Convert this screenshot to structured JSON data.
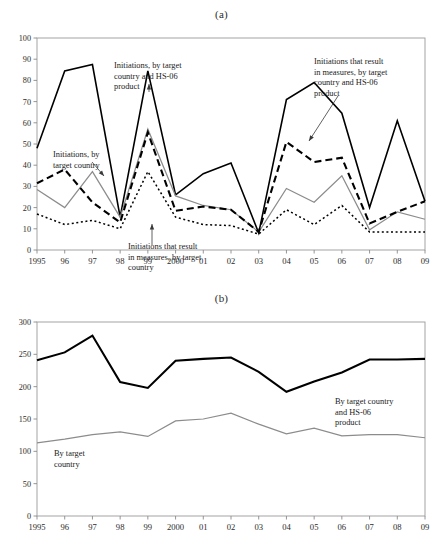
{
  "figure": {
    "panel_a_label": "(a)",
    "panel_b_label": "(b)"
  },
  "chart_data": [
    {
      "id": "panel-a",
      "type": "line",
      "title": "(a)",
      "xlabel": "",
      "ylabel": "",
      "xlim": [
        1995,
        2009
      ],
      "ylim": [
        0,
        100
      ],
      "grid": false,
      "legend": "annotations",
      "x": [
        1995,
        1996,
        1997,
        1998,
        1999,
        2000,
        2001,
        2002,
        2003,
        2004,
        2005,
        2006,
        2007,
        2008,
        2009
      ],
      "categories": [
        "1995",
        "96",
        "97",
        "98",
        "99",
        "2000",
        "01",
        "02",
        "03",
        "04",
        "05",
        "06",
        "07",
        "08",
        "09"
      ],
      "yticks": [
        0,
        10,
        20,
        30,
        40,
        50,
        60,
        70,
        80,
        90,
        100
      ],
      "series": [
        {
          "name": "Initiations, by target country and HS-06 product",
          "style": "solid-black",
          "values": [
            48,
            84.5,
            87.5,
            15.5,
            84.5,
            26,
            36,
            41,
            8,
            71,
            79,
            64.5,
            20,
            61,
            23
          ]
        },
        {
          "name": "Initiations, by target country",
          "style": "gray",
          "values": [
            28.5,
            20,
            37,
            15.5,
            57,
            25.5,
            21,
            19,
            8.5,
            29,
            22.5,
            35,
            9.5,
            18,
            14.5
          ]
        },
        {
          "name": "Initiations that result in measures, by target country and HS-06 product",
          "style": "dashed",
          "values": [
            31.5,
            38,
            22.5,
            13,
            55.5,
            18.5,
            20.5,
            19,
            8.5,
            51,
            41.5,
            43.5,
            12.5,
            18,
            23
          ]
        },
        {
          "name": "Initiations that result in measures, by target country",
          "style": "dotted",
          "values": [
            17,
            12,
            14,
            10,
            37,
            15.5,
            12,
            11.5,
            7.5,
            19,
            12,
            21,
            8.5,
            8.5,
            8.5
          ]
        }
      ],
      "annotations": [
        {
          "text": "Initiations, by target country",
          "lines": [
            "Initiations, by",
            "target country"
          ],
          "points_to_series": "Initiations, by target country"
        },
        {
          "text": "Initiations, by target country and HS-06 product",
          "lines": [
            "Initiations, by target",
            "country and HS-06",
            "product"
          ],
          "points_to_series": "Initiations, by target country and HS-06 product"
        },
        {
          "text": "Initiations that result in measures, by target country",
          "lines": [
            "Initiations that result",
            "in measures, by target",
            "country"
          ],
          "points_to_series": "Initiations that result in measures, by target country"
        },
        {
          "text": "Initiations that result in measures, by target country and HS-06 product",
          "lines": [
            "Initiations that result",
            "in measures, by target",
            "country and HS-06",
            "product"
          ],
          "points_to_series": "Initiations that result in measures, by target country and HS-06 product"
        }
      ]
    },
    {
      "id": "panel-b",
      "type": "line",
      "title": "(b)",
      "xlabel": "",
      "ylabel": "",
      "xlim": [
        1995,
        2009
      ],
      "ylim": [
        0,
        300
      ],
      "grid": false,
      "legend": "annotations",
      "x": [
        1995,
        1996,
        1997,
        1998,
        1999,
        2000,
        2001,
        2002,
        2003,
        2004,
        2005,
        2006,
        2007,
        2008,
        2009
      ],
      "categories": [
        "1995",
        "96",
        "97",
        "98",
        "99",
        "2000",
        "01",
        "02",
        "03",
        "04",
        "05",
        "06",
        "07",
        "08",
        "09"
      ],
      "yticks": [
        0,
        50,
        100,
        150,
        200,
        250,
        300
      ],
      "series": [
        {
          "name": "By target country and HS-06 product",
          "style": "thick-black",
          "values": [
            241,
            253,
            279,
            207,
            198,
            240,
            243,
            245,
            223,
            192,
            208,
            222,
            242,
            242,
            243
          ]
        },
        {
          "name": "By target country",
          "style": "gray",
          "values": [
            113,
            119,
            126,
            130,
            123,
            147,
            150,
            159,
            142,
            127,
            136,
            124,
            126,
            126,
            121
          ]
        }
      ],
      "annotations": [
        {
          "text": "By target country and HS-06 product",
          "lines": [
            "By target country",
            "and HS-06",
            "product"
          ],
          "points_to_series": "By target country and HS-06 product"
        },
        {
          "text": "By target country",
          "lines": [
            "By target",
            "country"
          ],
          "points_to_series": "By target country"
        }
      ]
    }
  ]
}
